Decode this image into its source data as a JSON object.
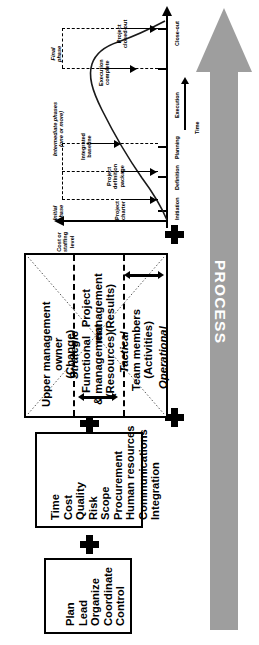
{
  "diagram": {
    "orientation": "rotated-90"
  },
  "process_arrow": {
    "label": "PROCESS",
    "color": "#9e9e9e",
    "text_color": "#ffffff",
    "direction": "up"
  },
  "lifecycle_chart": {
    "value_axis_label": "Cost or\nstaffing\nlevel",
    "value_axis_label_lines": [
      "Cost or",
      "staffing",
      "level"
    ],
    "time_axis_label": "Time",
    "phase_ticks": [
      "Initiation",
      "Definition",
      "Planning",
      "Execution",
      "Close-out"
    ],
    "phase_brackets": [
      {
        "name": "Initial\nphase",
        "lines": [
          "Initial",
          "phase"
        ]
      },
      {
        "name": "Intermediate phases\n(one or more)",
        "lines": [
          "Intermediate phases",
          "(one or more)"
        ]
      },
      {
        "name": "Final\nphase",
        "lines": [
          "Final",
          "phase"
        ]
      }
    ],
    "milestones": [
      {
        "label": "Project\ncharter",
        "lines": [
          "Project",
          "charter"
        ]
      },
      {
        "label": "Project\ndefinition\npackage",
        "lines": [
          "Project",
          "definition",
          "package"
        ]
      },
      {
        "label": "Integrated\nbaseline",
        "lines": [
          "Integrated",
          "baseline"
        ]
      },
      {
        "label": "Execution\ncomplete",
        "lines": [
          "Execution",
          "complete"
        ]
      },
      {
        "label": "Project\nclosed-out",
        "lines": [
          "Project",
          "closed-out"
        ]
      }
    ],
    "curve_description": "bell curve of cost or staffing level over project time"
  },
  "matrix_box": {
    "columns": [
      {
        "role": "Upper management\nowner",
        "role_lines": [
          "Upper management",
          "owner"
        ],
        "focus": "(Change)",
        "level": "Strategic"
      },
      {
        "role": "Project\nmanagement",
        "role_lines": [
          "Project",
          "management"
        ],
        "focus": "(Results)",
        "level": "Tactical",
        "second_role": "Functional\nmanagement",
        "second_role_lines": [
          "Functional",
          "&  management"
        ],
        "second_focus": "(Resources)"
      },
      {
        "role": "Team members",
        "role_lines": [
          "Team members"
        ],
        "focus": "(Activities)",
        "level": "Operational"
      }
    ],
    "labels": {
      "upper_management": "Upper management",
      "owner": "owner",
      "change": "(Change)",
      "strategic": "Strategic",
      "functional_management_1": "Functional",
      "functional_management_2": "&  management",
      "resources": "(Resources)",
      "project_management_1": "Project",
      "project_management_2": "management",
      "results": "(Results)",
      "tactical": "Tactical",
      "team_members": "Team members",
      "activities": "(Activities)",
      "operational": "Operational"
    }
  },
  "knowledge_box": {
    "items": [
      "Time",
      "Cost",
      "Quality",
      "Risk",
      "Scope",
      "Procurement",
      "Human resources",
      "Communications",
      "Integration"
    ]
  },
  "functions_box": {
    "items": [
      "Plan",
      "Lead",
      "Organize",
      "Coordinate",
      "Control"
    ]
  },
  "connectors": {
    "plus_symbol": "+",
    "count": 4
  }
}
